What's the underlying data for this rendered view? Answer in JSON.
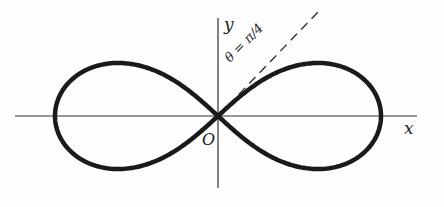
{
  "figure": {
    "curve": "lemniscate",
    "labels": {
      "x_axis": "x",
      "y_axis": "y",
      "origin": "O",
      "tangent_line": "θ = π/4"
    },
    "colors": {
      "curve": "#1a1a1a",
      "axes": "#333333",
      "background": "#fdfdfd"
    }
  }
}
